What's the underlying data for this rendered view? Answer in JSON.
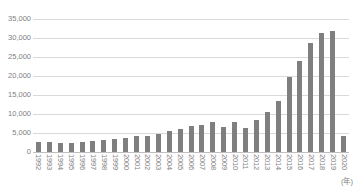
{
  "chart": {
    "axis_unit_label": "(年)",
    "bar_color": "#7f7f7f",
    "gridline_color": "#d9d9d9",
    "tick_label_color": "#808080",
    "background_color": "#ffffff"
  },
  "chart_data": {
    "type": "bar",
    "title": "",
    "subtitle": "",
    "xlabel": "(年)",
    "ylabel": "",
    "ylim": [
      0,
      35000
    ],
    "ytick_values": [
      0,
      5000,
      10000,
      15000,
      20000,
      25000,
      30000,
      35000
    ],
    "ytick_labels": [
      "0",
      "5,000",
      "10,000",
      "15,000",
      "20,000",
      "25,000",
      "30,000",
      "35,000"
    ],
    "grid": true,
    "legend": false,
    "categories": [
      "1992",
      "1993",
      "1994",
      "1995",
      "1996",
      "1997",
      "1998",
      "1999",
      "2000",
      "2001",
      "2002",
      "2003",
      "2004",
      "2005",
      "2006",
      "2007",
      "2008",
      "2009",
      "2010",
      "2011",
      "2012",
      "2013",
      "2014",
      "2015",
      "2016",
      "2017",
      "2018",
      "2019",
      "2020"
    ],
    "values": [
      2600,
      2700,
      2500,
      2400,
      2700,
      2900,
      3100,
      3300,
      3600,
      4100,
      4300,
      4800,
      5400,
      6100,
      6800,
      7200,
      7900,
      6600,
      8000,
      6200,
      8500,
      10400,
      13400,
      19700,
      24000,
      28700,
      31200,
      31900,
      4100
    ]
  }
}
